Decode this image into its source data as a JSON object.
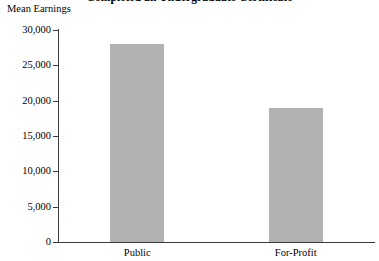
{
  "chart_data": {
    "type": "bar",
    "title": "Completed an Undergraduate Certificate",
    "xlabel": "",
    "ylabel": "Mean Earnings",
    "categories": [
      "Public",
      "For-Profit"
    ],
    "values": [
      28000,
      19000
    ],
    "ylim": [
      0,
      30000
    ],
    "ytick_values": [
      0,
      5000,
      10000,
      15000,
      20000,
      25000,
      30000
    ],
    "ytick_labels": [
      "0",
      "5,000",
      "10,000",
      "15,000",
      "20,000",
      "25,000",
      "30,000"
    ],
    "grid": false,
    "legend": null,
    "bar_color": "#b2b2b2",
    "axis_color": "#3c3c3c",
    "text_color": "#000000"
  },
  "axis": {
    "y_title": "Mean Earnings"
  },
  "title": {
    "text": "Completed an Undergraduate Certificate"
  }
}
